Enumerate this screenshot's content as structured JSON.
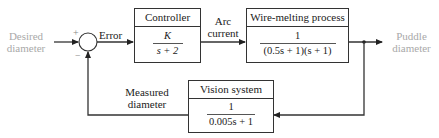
{
  "diagram": {
    "type": "feedback block diagram",
    "input": {
      "label_line1": "Desired",
      "label_line2": "diameter"
    },
    "output": {
      "label_line1": "Puddle",
      "label_line2": "diameter"
    },
    "summing_junction": {
      "plus_sign": "+",
      "minus_sign": "−"
    },
    "signals": {
      "error": "Error",
      "arc_current_line1": "Arc",
      "arc_current_line2": "current",
      "measured_line1": "Measured",
      "measured_line2": "diameter"
    },
    "blocks": {
      "controller": {
        "title": "Controller",
        "numerator": "K",
        "denominator": "s + 2"
      },
      "process": {
        "title": "Wire-melting process",
        "numerator": "1",
        "denominator": "(0.5s + 1)(s + 1)"
      },
      "sensor": {
        "title": "Vision system",
        "numerator": "1",
        "denominator": "0.005s + 1"
      }
    },
    "colors": {
      "line": "#333333",
      "input_output_label": "#a9a9a9"
    }
  }
}
